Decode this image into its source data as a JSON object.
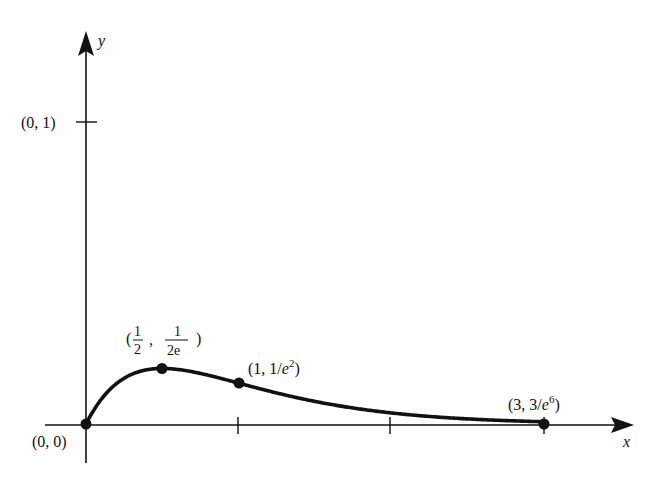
{
  "figure": {
    "function": "y = x e^(-2x)",
    "axes": {
      "x_label": "x",
      "y_label": "y",
      "origin_px": [
        86,
        424
      ],
      "x_unit_px": 152.7,
      "y_unit_px": 302,
      "x_ticks": [
        1,
        2
      ],
      "y_ticks": [
        1
      ],
      "y_tick_label": "(0, 1)"
    },
    "points": [
      {
        "name": "origin",
        "x": 0,
        "y": 0,
        "label": "(0, 0)"
      },
      {
        "name": "maximum",
        "x": 0.5,
        "y": 0.1839,
        "label_open": "(",
        "label_num1": "1",
        "label_den1": "2",
        "label_sep": ",",
        "label_num2": "1",
        "label_den2": "2e",
        "label_close": ")"
      },
      {
        "name": "inflection",
        "x": 1,
        "y": 0.1353,
        "label_prefix": "(1, 1/",
        "label_e": "e",
        "label_exp": "2",
        "label_suffix": ")"
      },
      {
        "name": "end",
        "x": 3,
        "y": 0.0074,
        "label_prefix": "(3, 3/",
        "label_e": "e",
        "label_exp": "6",
        "label_suffix": ")"
      }
    ],
    "colors": {
      "ink": "#111111",
      "background": "#ffffff"
    }
  },
  "chart_data": {
    "type": "line",
    "title": "",
    "xlabel": "x",
    "ylabel": "y",
    "x": [
      0,
      0.25,
      0.5,
      0.75,
      1,
      1.5,
      2,
      2.5,
      3
    ],
    "series": [
      {
        "name": "y = x e^{-2x}",
        "values": [
          0,
          0.1516,
          0.1839,
          0.1674,
          0.1353,
          0.0747,
          0.0366,
          0.0168,
          0.0074
        ]
      }
    ],
    "annotations": [
      "(0, 0)",
      "(0, 1)",
      "(1/2, 1/(2e))",
      "(1, 1/e^2)",
      "(3, 3/e^6)"
    ],
    "xlim": [
      -0.27,
      3.58
    ],
    "ylim": [
      -0.13,
      1.3
    ],
    "grid": false,
    "legend": "none"
  }
}
